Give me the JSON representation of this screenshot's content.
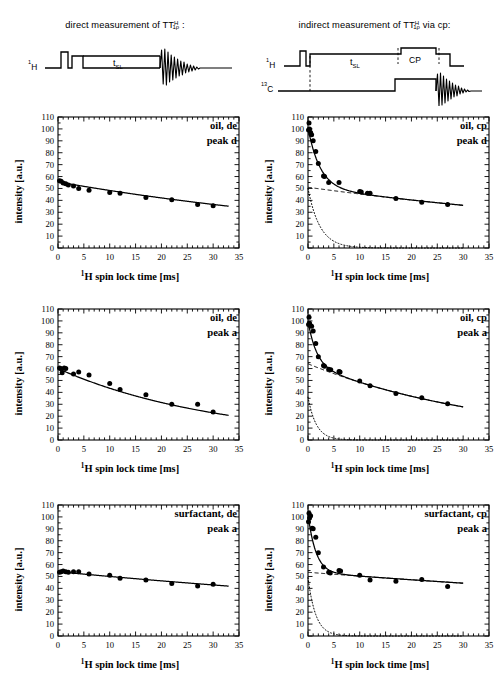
{
  "figure": {
    "artifact_mark": "vertical-tick-mark"
  },
  "sequences": [
    {
      "id": "direct",
      "title_parts": {
        "pre": "direct measurement of T",
        "sup": "H",
        "sub": "1ρ",
        "post": " :"
      },
      "title_text": "direct measurement of T1ρH :",
      "channels": [
        "1H"
      ],
      "labels": {
        "tsl": "t",
        "tsl_sub": "SL"
      }
    },
    {
      "id": "indirect-cp",
      "title_parts": {
        "pre": "indirect measurement of T",
        "sup": "H",
        "sub": "1ρ",
        "post": " via cp:"
      },
      "title_text": "indirect measurement of T1ρH via cp:",
      "channels": [
        "1H",
        "13C"
      ],
      "labels": {
        "tsl": "t",
        "tsl_sub": "SL",
        "cp": "CP"
      }
    }
  ],
  "axes_common": {
    "xlabel_pre": "1",
    "xlabel_main": "H spin lock time [ms]",
    "ylabel": "intensity [a.u.]",
    "xlim": [
      0,
      35
    ],
    "ylim": [
      0,
      110
    ],
    "xticks": [
      0,
      5,
      10,
      15,
      20,
      25,
      30,
      35
    ],
    "yticks": [
      0,
      10,
      20,
      30,
      40,
      50,
      60,
      70,
      80,
      90,
      100,
      110
    ],
    "xminor_step": 1,
    "yminor_step": 5,
    "grid": false,
    "legend": "none"
  },
  "chart_data": [
    {
      "id": "oil-de-peak-d",
      "type": "scatter",
      "title": "",
      "annotation_lines": [
        "oil, de",
        "peak d"
      ],
      "sample": "oil",
      "method": "de",
      "peak": "d",
      "xlabel": "1H spin lock time [ms]",
      "ylabel": "intensity [a.u.]",
      "xlim": [
        0,
        35
      ],
      "ylim": [
        0,
        110
      ],
      "x": [
        0.3,
        0.6,
        1.0,
        1.5,
        2.0,
        3.0,
        4.0,
        6.0,
        10.0,
        12.0,
        17.0,
        22.0,
        27.0,
        30.0
      ],
      "y": [
        56.5,
        56.0,
        54.5,
        54.0,
        53.0,
        52.0,
        50.0,
        48.5,
        46.5,
        46.0,
        42.5,
        40.5,
        36.5,
        35.5
      ],
      "fit": {
        "kind": "monoexponential",
        "a": 55.5,
        "t1rho": 72.0,
        "offset": 0
      },
      "components": []
    },
    {
      "id": "oil-cp-peak-d",
      "type": "scatter",
      "title": "",
      "annotation_lines": [
        "oil, cp",
        "peak d"
      ],
      "sample": "oil",
      "method": "cp",
      "peak": "d",
      "xlabel": "1H spin lock time [ms]",
      "ylabel": "intensity [a.u.]",
      "xlim": [
        0,
        35
      ],
      "ylim": [
        0,
        110
      ],
      "x": [
        0.1,
        0.2,
        0.3,
        0.5,
        0.7,
        1.0,
        1.5,
        2.0,
        3.0,
        3.2,
        4.0,
        6.0,
        10.0,
        10.3,
        11.5,
        12.0,
        17.0,
        22.0,
        27.0
      ],
      "y": [
        99.0,
        105.0,
        100.0,
        97.0,
        95.0,
        90.0,
        81.0,
        71.0,
        60.5,
        60.0,
        55.0,
        55.0,
        47.5,
        47.0,
        46.0,
        46.0,
        41.5,
        38.5,
        36.5
      ],
      "fit": {
        "kind": "biexponential",
        "a_fast": 50.0,
        "t_fast": 2.3,
        "a_slow": 51.0,
        "t_slow": 85.0
      },
      "components": [
        {
          "name": "slow component",
          "style": "dashed",
          "amplitude": 51.0,
          "t1rho": 85.0
        },
        {
          "name": "fast component",
          "style": "dotted",
          "amplitude": 50.0,
          "t1rho": 2.3
        }
      ]
    },
    {
      "id": "oil-de-peak-a",
      "type": "scatter",
      "title": "",
      "annotation_lines": [
        "oil, de",
        "peak a"
      ],
      "sample": "oil",
      "method": "de",
      "peak": "a",
      "xlabel": "1H spin lock time [ms]",
      "ylabel": "intensity [a.u.]",
      "xlim": [
        0,
        35
      ],
      "ylim": [
        0,
        110
      ],
      "x": [
        0.3,
        0.5,
        0.8,
        1.2,
        1.5,
        3.0,
        4.0,
        6.0,
        10.0,
        12.0,
        17.0,
        22.0,
        27.0,
        30.0
      ],
      "y": [
        60.5,
        60.0,
        56.5,
        60.5,
        60.0,
        55.5,
        57.0,
        54.5,
        47.5,
        42.5,
        38.0,
        30.0,
        30.0,
        23.5
      ],
      "fit": {
        "kind": "monoexponential",
        "a": 60.0,
        "t1rho": 31.0,
        "offset": 0
      },
      "components": []
    },
    {
      "id": "oil-cp-peak-a",
      "type": "scatter",
      "title": "",
      "annotation_lines": [
        "oil, cp",
        "peak a"
      ],
      "sample": "oil",
      "method": "cp",
      "peak": "a",
      "xlabel": "1H spin lock time [ms]",
      "ylabel": "intensity [a.u.]",
      "xlim": [
        0,
        35
      ],
      "ylim": [
        0,
        110
      ],
      "x": [
        0.1,
        0.2,
        0.3,
        0.5,
        0.7,
        1.0,
        1.5,
        2.0,
        3.0,
        3.2,
        4.0,
        4.4,
        6.0,
        6.2,
        10.0,
        12.0,
        17.0,
        22.0,
        27.0
      ],
      "y": [
        97.0,
        103.0,
        98.0,
        96.0,
        95.5,
        91.5,
        81.0,
        70.0,
        62.5,
        62.0,
        59.5,
        59.0,
        57.5,
        57.0,
        49.5,
        45.5,
        39.0,
        35.5,
        30.5
      ],
      "fit": {
        "kind": "biexponential",
        "a_fast": 36.0,
        "t_fast": 1.6,
        "a_slow": 64.0,
        "t_slow": 36.0
      },
      "components": [
        {
          "name": "slow component",
          "style": "dashed",
          "amplitude": 64.0,
          "t1rho": 36.0
        },
        {
          "name": "fast component",
          "style": "dotted",
          "amplitude": 36.0,
          "t1rho": 1.6
        }
      ]
    },
    {
      "id": "surfactant-de-peak-a",
      "type": "scatter",
      "title": "",
      "annotation_lines": [
        "surfactant, de",
        "peak a"
      ],
      "sample": "surfactant",
      "method": "de",
      "peak": "a",
      "xlabel": "1H spin lock time [ms]",
      "ylabel": "intensity [a.u.]",
      "xlim": [
        0,
        35
      ],
      "ylim": [
        0,
        110
      ],
      "x": [
        0.3,
        0.6,
        1.0,
        1.5,
        2.0,
        3.0,
        4.0,
        6.0,
        10.0,
        12.0,
        17.0,
        22.0,
        27.0,
        30.0
      ],
      "y": [
        53.5,
        54.0,
        54.5,
        54.0,
        53.5,
        54.0,
        54.0,
        52.0,
        51.0,
        48.5,
        47.0,
        44.0,
        42.0,
        43.5
      ],
      "fit": {
        "kind": "monoexponential",
        "a": 54.0,
        "t1rho": 130.0,
        "offset": 0
      },
      "components": []
    },
    {
      "id": "surfactant-cp-peak-a",
      "type": "scatter",
      "title": "",
      "annotation_lines": [
        "surfactant, cp",
        "peak a"
      ],
      "sample": "surfactant",
      "method": "cp",
      "peak": "a",
      "xlabel": "1H spin lock time [ms]",
      "ylabel": "intensity [a.u.]",
      "xlim": [
        0,
        35
      ],
      "ylim": [
        0,
        110
      ],
      "x": [
        0.1,
        0.2,
        0.3,
        0.5,
        0.8,
        1.0,
        1.5,
        2.0,
        3.0,
        4.0,
        4.3,
        6.0,
        6.3,
        10.0,
        12.0,
        17.0,
        22.0,
        27.0
      ],
      "y": [
        96.0,
        103.0,
        99.0,
        101.0,
        90.5,
        90.0,
        83.0,
        70.0,
        58.0,
        53.5,
        53.0,
        55.0,
        54.5,
        51.0,
        47.0,
        46.0,
        47.5,
        41.5
      ],
      "fit": {
        "kind": "biexponential",
        "a_fast": 49.0,
        "t_fast": 1.5,
        "a_slow": 53.5,
        "t_slow": 160.0
      },
      "components": [
        {
          "name": "slow component",
          "style": "dashed",
          "amplitude": 53.5,
          "t1rho": 160.0
        },
        {
          "name": "fast component",
          "style": "dotted",
          "amplitude": 49.0,
          "t1rho": 1.5
        }
      ]
    }
  ]
}
